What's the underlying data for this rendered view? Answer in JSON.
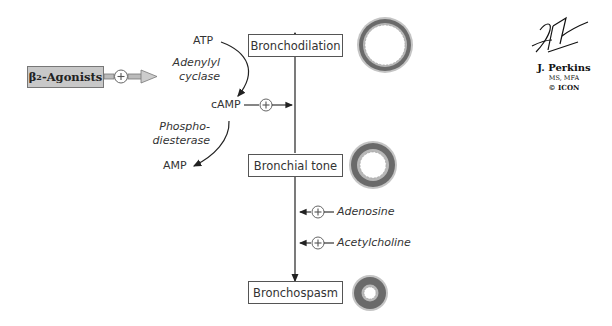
{
  "diagram": {
    "agonist": {
      "prefix": "β",
      "subscript": "2",
      "suffix": "-Agonists"
    },
    "pathway": {
      "atp": "ATP",
      "enzyme_1": [
        "Adenylyl",
        "cyclase"
      ],
      "camp": "cAMP",
      "enzyme_2": [
        "Phospho-",
        "diesterase"
      ],
      "amp": "AMP"
    },
    "states": {
      "top": "Bronchodilation",
      "middle": "Bronchial tone",
      "bottom": "Bronchospasm"
    },
    "modulators": [
      {
        "label": "Adenosine",
        "effect": "+"
      },
      {
        "label": "Acetylcholine",
        "effect": "+"
      }
    ],
    "plus_symbol": "+",
    "colors": {
      "agonist_box": "#c8c8c8",
      "ring_dark": "#6a6a6a",
      "ring_light": "#b5b5b5",
      "line": "#222222"
    }
  },
  "credit": {
    "signature": "F. Netter M.D.",
    "artist": "J. Perkins",
    "degree": "MS, MFA",
    "copyright": "© ICON"
  }
}
